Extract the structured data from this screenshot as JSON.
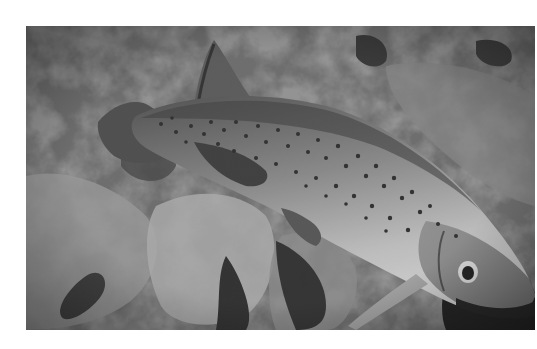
{
  "photo": {
    "alt": "Grayscale underwater photograph of a spotted trout resting over rocky riverbed",
    "subject": "spotted trout",
    "colors": {
      "background_rock": "#6b6b6b",
      "rock_light": "#a9a9a9",
      "rock_dark": "#2e2e2e",
      "fish_back": "#5a5a5a",
      "fish_belly": "#c8c8c8",
      "spot": "#2a2a2a",
      "eye_ring": "#e8e8e8",
      "page_bg": "#ffffff"
    }
  }
}
